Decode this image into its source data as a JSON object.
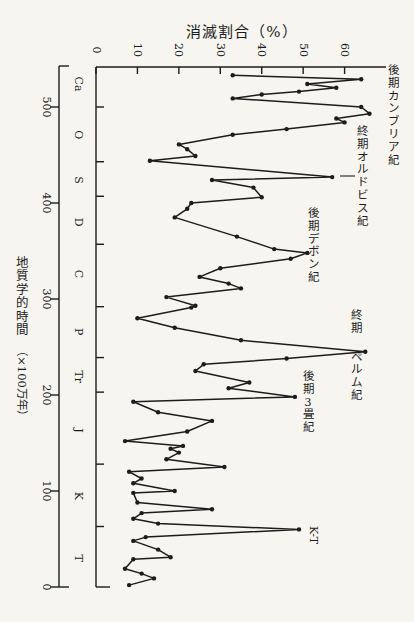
{
  "page": {
    "paper_color": "#f6f5f0",
    "ink_color": "#1c1c1c"
  },
  "chart_data": {
    "type": "line",
    "orientation": "rotated-90 (time runs vertically top=old, bottom=present; extinction % runs horizontally)",
    "title_top": "消滅割合（%）",
    "title_left": "地質学的時間（×100万年）",
    "marker": "filled-dot",
    "grid": false,
    "pct_axis": {
      "min": 0,
      "max": 70,
      "ticks": [
        0,
        10,
        20,
        30,
        40,
        50,
        60
      ],
      "label_rotation": "90deg"
    },
    "time_axis": {
      "min": 0,
      "max": 542,
      "ticks": [
        500,
        400,
        300,
        200,
        100,
        0
      ],
      "label_rotation": "90deg"
    },
    "period_boundaries_ma": [
      500,
      443,
      407,
      357,
      292,
      239,
      203,
      128,
      63
    ],
    "periods": [
      {
        "label": "Ca",
        "t": 524
      },
      {
        "label": "O",
        "t": 471
      },
      {
        "label": "S",
        "t": 424
      },
      {
        "label": "D",
        "t": 380
      },
      {
        "label": "C",
        "t": 326
      },
      {
        "label": "P",
        "t": 266
      },
      {
        "label": "Tr",
        "t": 219
      },
      {
        "label": "J",
        "t": 163
      },
      {
        "label": "K",
        "t": 95
      },
      {
        "label": "T",
        "t": 30
      }
    ],
    "points_time_pct": [
      [
        533,
        33
      ],
      [
        529,
        64
      ],
      [
        524,
        51
      ],
      [
        520,
        58
      ],
      [
        516,
        49
      ],
      [
        513,
        40
      ],
      [
        509,
        33
      ],
      [
        500,
        64
      ],
      [
        493,
        66
      ],
      [
        488,
        58
      ],
      [
        484,
        60
      ],
      [
        477,
        46
      ],
      [
        471,
        33
      ],
      [
        461,
        20
      ],
      [
        456,
        22
      ],
      [
        449,
        24
      ],
      [
        444,
        13
      ],
      [
        427,
        57
      ],
      [
        424,
        28
      ],
      [
        416,
        38
      ],
      [
        406,
        40
      ],
      [
        400,
        23
      ],
      [
        394,
        22
      ],
      [
        385,
        19
      ],
      [
        365,
        34
      ],
      [
        352,
        43
      ],
      [
        348,
        51
      ],
      [
        342,
        47
      ],
      [
        332,
        30
      ],
      [
        323,
        25
      ],
      [
        316,
        32
      ],
      [
        311,
        35
      ],
      [
        302,
        17
      ],
      [
        293,
        24
      ],
      [
        291,
        23
      ],
      [
        280,
        10
      ],
      [
        270,
        19
      ],
      [
        257,
        35
      ],
      [
        245,
        65
      ],
      [
        238,
        46
      ],
      [
        232,
        26
      ],
      [
        225,
        24
      ],
      [
        213,
        37
      ],
      [
        207,
        32
      ],
      [
        198,
        48
      ],
      [
        193,
        9
      ],
      [
        182,
        15
      ],
      [
        173,
        28
      ],
      [
        162,
        22
      ],
      [
        152,
        7
      ],
      [
        147,
        21
      ],
      [
        144,
        18
      ],
      [
        140,
        20
      ],
      [
        133,
        17
      ],
      [
        125,
        31
      ],
      [
        120,
        8
      ],
      [
        113,
        11
      ],
      [
        108,
        9
      ],
      [
        100,
        19
      ],
      [
        98,
        9
      ],
      [
        88,
        10
      ],
      [
        81,
        28
      ],
      [
        77,
        11
      ],
      [
        71,
        9
      ],
      [
        66,
        15
      ],
      [
        60,
        49
      ],
      [
        52,
        12
      ],
      [
        48,
        9
      ],
      [
        39,
        15
      ],
      [
        31,
        18
      ],
      [
        29,
        9
      ],
      [
        19,
        7
      ],
      [
        14,
        11
      ],
      [
        9,
        14
      ],
      [
        2,
        8
      ]
    ],
    "annotations": [
      {
        "text": "後期カンブリア紀",
        "kind": "vertical",
        "x": 393,
        "y": 70
      },
      {
        "text": "終期オルドビス紀",
        "kind": "vertical",
        "x": 362,
        "y": 131,
        "leader": {
          "x1": 340,
          "y1": 176,
          "x2": 355,
          "y2": 176
        }
      },
      {
        "text": "後期デボン紀",
        "kind": "vertical",
        "x": 313,
        "y": 213
      },
      {
        "text": "終期ペルム紀",
        "kind": "vertical",
        "x": 356,
        "y": 315,
        "break_after": 2,
        "break_gap": 16
      },
      {
        "text": "後期3畳紀",
        "kind": "vertical",
        "x": 308,
        "y": 376
      },
      {
        "text": "K-T",
        "kind": "rotated",
        "x": 313,
        "y": 535
      }
    ]
  }
}
